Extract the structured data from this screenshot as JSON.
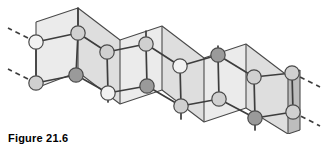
{
  "figure": {
    "caption": "Figure 21.6",
    "type": "puckered-layer-lattice-diagram",
    "colors": {
      "background": "#ffffff",
      "panel_light": "#ebebeb",
      "panel_mid": "#dedede",
      "panel_dark": "#cfcfcf",
      "panel_edge": "#bdbdbd",
      "outline": "#4a4a4a",
      "bond": "#3d3d3d",
      "atom_white": "#f2f2f2",
      "atom_light": "#d0d0d0",
      "atom_dark": "#9a9a9a",
      "atom_stroke": "#4a4a4a",
      "caption_color": "#000000"
    },
    "geometry": {
      "atom_radius": 7.2,
      "bond_width": 1.7,
      "outline_width": 1.1,
      "dash_pattern": "5,4"
    },
    "panels": [
      {
        "name": "panel-1-front",
        "shade": "panel_light",
        "points": "36,22 78,8 78,72 36,88"
      },
      {
        "name": "panel-2-back",
        "shade": "panel_mid",
        "points": "78,8 120,40 120,104 78,72"
      },
      {
        "name": "panel-3-front",
        "shade": "panel_light",
        "points": "120,40 162,26 162,90 120,104"
      },
      {
        "name": "panel-4-back",
        "shade": "panel_mid",
        "points": "162,26 204,58 204,122 162,90"
      },
      {
        "name": "panel-5-front",
        "shade": "panel_light",
        "points": "204,58 246,44 246,108 204,122"
      },
      {
        "name": "panel-6-back",
        "shade": "panel_mid",
        "points": "246,44 288,76 288,134 246,108"
      },
      {
        "name": "panel-7-edge",
        "shade": "panel_edge",
        "points": "288,76 300,70 300,130 288,134"
      }
    ],
    "fold_lines": [
      {
        "name": "fold-line-1",
        "x1": 36,
        "y1": 22,
        "x2": 36,
        "y2": 88
      },
      {
        "name": "fold-line-2",
        "x1": 78,
        "y1": 8,
        "x2": 78,
        "y2": 72
      },
      {
        "name": "fold-line-3",
        "x1": 120,
        "y1": 40,
        "x2": 120,
        "y2": 104
      },
      {
        "name": "fold-line-4",
        "x1": 162,
        "y1": 26,
        "x2": 162,
        "y2": 90
      },
      {
        "name": "fold-line-5",
        "x1": 204,
        "y1": 58,
        "x2": 204,
        "y2": 122
      },
      {
        "name": "fold-line-6",
        "x1": 246,
        "y1": 44,
        "x2": 246,
        "y2": 108
      },
      {
        "name": "fold-line-7",
        "x1": 288,
        "y1": 76,
        "x2": 288,
        "y2": 134
      },
      {
        "name": "fold-line-8",
        "x1": 300,
        "y1": 70,
        "x2": 300,
        "y2": 130
      }
    ],
    "top_edge": "36,22 78,8 120,40 162,26 204,58 246,44 288,76 300,70",
    "bottom_edge": "36,88 78,72 120,104 162,90 204,122 246,108 288,134 300,130",
    "atoms": [
      {
        "id": "a1",
        "name": "atom-row1-1",
        "cx": 36,
        "cy": 42,
        "shade": "atom_white"
      },
      {
        "id": "a2",
        "name": "atom-row1-2",
        "cx": 78,
        "cy": 33,
        "shade": "atom_light"
      },
      {
        "id": "a3",
        "name": "atom-row1-3",
        "cx": 107,
        "cy": 52,
        "shade": "atom_light"
      },
      {
        "id": "a4",
        "name": "atom-row1-4",
        "cx": 146,
        "cy": 44,
        "shade": "atom_light"
      },
      {
        "id": "a5",
        "name": "atom-row1-5",
        "cx": 180,
        "cy": 66,
        "shade": "atom_white"
      },
      {
        "id": "a6",
        "name": "atom-row1-6",
        "cx": 218,
        "cy": 55,
        "shade": "atom_dark"
      },
      {
        "id": "a7",
        "name": "atom-row1-7",
        "cx": 254,
        "cy": 77,
        "shade": "atom_light"
      },
      {
        "id": "a8",
        "name": "atom-row1-8",
        "cx": 292,
        "cy": 73,
        "shade": "atom_light"
      },
      {
        "id": "b1",
        "name": "atom-row2-1",
        "cx": 36,
        "cy": 83,
        "shade": "atom_light"
      },
      {
        "id": "b2",
        "name": "atom-row2-2",
        "cx": 76,
        "cy": 75,
        "shade": "atom_dark"
      },
      {
        "id": "b3",
        "name": "atom-row2-3",
        "cx": 108,
        "cy": 93,
        "shade": "atom_white"
      },
      {
        "id": "b4",
        "name": "atom-row2-4",
        "cx": 147,
        "cy": 86,
        "shade": "atom_dark"
      },
      {
        "id": "b5",
        "name": "atom-row2-5",
        "cx": 181,
        "cy": 106,
        "shade": "atom_light"
      },
      {
        "id": "b6",
        "name": "atom-row2-6",
        "cx": 219,
        "cy": 99,
        "shade": "atom_light"
      },
      {
        "id": "b7",
        "name": "atom-row2-7",
        "cx": 255,
        "cy": 118,
        "shade": "atom_dark"
      },
      {
        "id": "b8",
        "name": "atom-row2-8",
        "cx": 293,
        "cy": 112,
        "shade": "atom_light"
      }
    ],
    "bonds": [
      {
        "name": "bond-a1-a2",
        "x1": 36,
        "y1": 42,
        "x2": 78,
        "y2": 33
      },
      {
        "name": "bond-a2-a3",
        "x1": 78,
        "y1": 33,
        "x2": 107,
        "y2": 52
      },
      {
        "name": "bond-a3-a4",
        "x1": 107,
        "y1": 52,
        "x2": 146,
        "y2": 44
      },
      {
        "name": "bond-a4-a5",
        "x1": 146,
        "y1": 44,
        "x2": 180,
        "y2": 66
      },
      {
        "name": "bond-a5-a6",
        "x1": 180,
        "y1": 66,
        "x2": 218,
        "y2": 55
      },
      {
        "name": "bond-a6-a7",
        "x1": 218,
        "y1": 55,
        "x2": 254,
        "y2": 77
      },
      {
        "name": "bond-a7-a8",
        "x1": 254,
        "y1": 77,
        "x2": 292,
        "y2": 73
      },
      {
        "name": "bond-b1-b2",
        "x1": 36,
        "y1": 83,
        "x2": 76,
        "y2": 75
      },
      {
        "name": "bond-b2-b3",
        "x1": 76,
        "y1": 75,
        "x2": 108,
        "y2": 93
      },
      {
        "name": "bond-b3-b4",
        "x1": 108,
        "y1": 93,
        "x2": 147,
        "y2": 86
      },
      {
        "name": "bond-b4-b5",
        "x1": 147,
        "y1": 86,
        "x2": 181,
        "y2": 106
      },
      {
        "name": "bond-b5-b6",
        "x1": 181,
        "y1": 106,
        "x2": 219,
        "y2": 99
      },
      {
        "name": "bond-b6-b7",
        "x1": 219,
        "y1": 99,
        "x2": 255,
        "y2": 118
      },
      {
        "name": "bond-b7-b8",
        "x1": 255,
        "y1": 118,
        "x2": 293,
        "y2": 112
      },
      {
        "name": "bond-vert-a1-b1",
        "x1": 36,
        "y1": 42,
        "x2": 36,
        "y2": 83
      },
      {
        "name": "bond-vert-a2-b2",
        "x1": 78,
        "y1": 33,
        "x2": 76,
        "y2": 75
      },
      {
        "name": "bond-vert-a3-b3",
        "x1": 107,
        "y1": 52,
        "x2": 108,
        "y2": 93
      },
      {
        "name": "bond-vert-a4-b4",
        "x1": 146,
        "y1": 44,
        "x2": 147,
        "y2": 86
      },
      {
        "name": "bond-vert-a5-b5",
        "x1": 180,
        "y1": 66,
        "x2": 181,
        "y2": 106
      },
      {
        "name": "bond-vert-a6-b6",
        "x1": 218,
        "y1": 55,
        "x2": 219,
        "y2": 99
      },
      {
        "name": "bond-vert-a7-b7",
        "x1": 254,
        "y1": 77,
        "x2": 255,
        "y2": 118
      },
      {
        "name": "bond-vert-a8-b8",
        "x1": 292,
        "y1": 73,
        "x2": 293,
        "y2": 112
      },
      {
        "name": "bond-stub-a2-up",
        "x1": 78,
        "y1": 33,
        "x2": 78,
        "y2": 8
      },
      {
        "name": "bond-stub-a4-up",
        "x1": 146,
        "y1": 44,
        "x2": 146,
        "y2": 31
      },
      {
        "name": "bond-stub-a6-up",
        "x1": 218,
        "y1": 55,
        "x2": 218,
        "y2": 46
      },
      {
        "name": "bond-stub-b3-dn",
        "x1": 108,
        "y1": 93,
        "x2": 108,
        "y2": 102
      },
      {
        "name": "bond-stub-b5-dn",
        "x1": 181,
        "y1": 106,
        "x2": 181,
        "y2": 119
      },
      {
        "name": "bond-stub-b7-dn",
        "x1": 255,
        "y1": 118,
        "x2": 255,
        "y2": 130
      }
    ],
    "dashed_bonds": [
      {
        "name": "dashed-bond-left-upper",
        "x1": 36,
        "y1": 42,
        "x2": 8,
        "y2": 28
      },
      {
        "name": "dashed-bond-left-lower",
        "x1": 36,
        "y1": 83,
        "x2": 8,
        "y2": 69
      },
      {
        "name": "dashed-bond-right-upper",
        "x1": 292,
        "y1": 73,
        "x2": 320,
        "y2": 87
      },
      {
        "name": "dashed-bond-right-lower",
        "x1": 293,
        "y1": 112,
        "x2": 320,
        "y2": 126
      }
    ]
  }
}
